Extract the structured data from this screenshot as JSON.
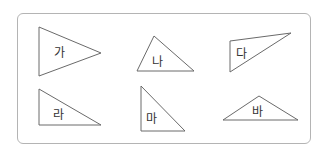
{
  "figure": {
    "type": "triangle-classification",
    "border_color": "#b4b4b4",
    "stroke_color": "#6a6a6a",
    "shapes": [
      {
        "label": "가",
        "points": "39,27 101,53 39,76",
        "label_x": 54,
        "label_y": 57
      },
      {
        "label": "나",
        "points": "154,36 137,71 194,71",
        "label_x": 152,
        "label_y": 66
      },
      {
        "label": "다",
        "points": "230,41 291,33 230,72",
        "label_x": 236,
        "label_y": 58
      },
      {
        "label": "라",
        "points": "39,89 101,125 39,125",
        "label_x": 53,
        "label_y": 119
      },
      {
        "label": "마",
        "points": "141,86 185,131 141,131",
        "label_x": 146,
        "label_y": 123
      },
      {
        "label": "바",
        "points": "223,120 259,96 298,120",
        "label_x": 252,
        "label_y": 116
      }
    ]
  }
}
